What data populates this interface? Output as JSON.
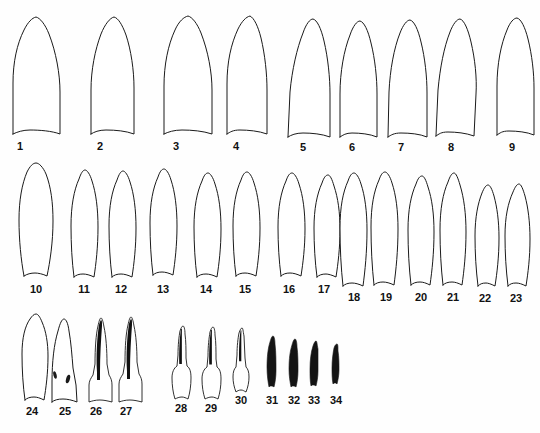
{
  "figure": {
    "kind": "scientific-plate",
    "background_color": "#fefefe",
    "outline_color": "#1a1a1a",
    "fill_color": "#ffffff",
    "solid_color": "#141414",
    "label_color": "#111111",
    "item_count": 34,
    "rows": [
      {
        "name": "row-1",
        "labels_from": 1,
        "labels_to": 9
      },
      {
        "name": "row-2",
        "labels_from": 10,
        "labels_to": 23
      },
      {
        "name": "row-3",
        "labels_from": 24,
        "labels_to": 34
      }
    ]
  },
  "specimens": [
    {
      "label": "1",
      "row": 1,
      "style": "outline",
      "label_x": 20,
      "label_y": 150,
      "path": "M 13 134 L 13 83 C 13 62 17 44 24 30 C 28 22 32 18 36 17 C 40 18 45 24 49 34 C 56 52 60 74 60 92 L 60 134 C 52 131 40 130 30 130 C 23 130 17 132 13 134 Z"
    },
    {
      "label": "2",
      "row": 1,
      "style": "outline",
      "label_x": 100,
      "label_y": 150,
      "path": "M 91 134 L 91 90 C 91 70 95 50 101 34 C 105 24 110 18 114 17 C 118 18 122 24 126 35 C 131 50 134 70 134 88 L 134 134 C 126 131 116 130 106 130 C 99 130 94 132 91 134 Z"
    },
    {
      "label": "3",
      "row": 1,
      "style": "outline",
      "label_x": 176,
      "label_y": 150,
      "path": "M 164 134 L 164 86 C 164 65 168 45 175 30 C 179 21 184 17 188 16 C 192 17 197 23 201 33 C 208 51 212 72 212 90 L 212 134 C 203 131 192 130 182 130 C 174 130 168 132 164 134 Z"
    },
    {
      "label": "4",
      "row": 1,
      "style": "outline",
      "label_x": 236,
      "label_y": 150,
      "path": "M 227 134 L 227 84 C 227 62 231 44 238 29 C 242 21 246 17 250 16 C 254 18 258 26 261 38 C 265 55 267 74 267 90 L 267 134 C 259 131 248 130 240 130 C 233 130 230 132 227 134 Z"
    },
    {
      "label": "5",
      "row": 1,
      "style": "outline",
      "label_x": 303,
      "label_y": 151,
      "path": "M 288 137 L 290 92 C 292 70 297 48 303 33 C 306 24 310 19 313 19 C 317 20 321 28 324 41 C 328 58 330 78 330 94 L 330 137 C 322 134 312 133 303 133 C 296 133 291 135 288 137 Z"
    },
    {
      "label": "6",
      "row": 1,
      "style": "outline",
      "label_x": 352,
      "label_y": 151,
      "path": "M 340 137 L 340 94 C 340 72 344 50 350 35 C 353 26 357 21 360 21 C 364 22 368 30 371 43 C 375 59 377 78 377 94 L 377 137 C 370 134 360 133 352 133 C 346 133 343 135 340 137 Z"
    },
    {
      "label": "7",
      "row": 1,
      "style": "outline",
      "label_x": 401,
      "label_y": 151,
      "path": "M 388 137 L 389 92 C 390 70 394 48 400 33 C 403 25 407 20 410 20 C 414 21 418 29 421 42 C 425 58 427 77 427 93 L 427 137 C 420 134 410 133 401 133 C 394 133 391 135 388 137 Z"
    },
    {
      "label": "8",
      "row": 1,
      "style": "outline",
      "label_x": 451,
      "label_y": 151,
      "path": "M 436 136 L 438 90 C 440 68 444 47 450 32 C 453 24 457 19 460 19 C 464 20 468 29 471 42 C 475 59 477 78 476 94 L 474 136 C 466 133 456 132 448 132 C 441 132 439 134 436 136 Z"
    },
    {
      "label": "9",
      "row": 1,
      "style": "outline",
      "label_x": 512,
      "label_y": 151,
      "path": "M 497 135 L 497 86 C 497 64 501 44 507 30 C 510 22 514 18 517 18 C 521 19 525 27 528 39 C 532 55 534 73 534 88 L 534 135 C 527 132 517 131 509 131 C 502 131 500 133 497 135 Z"
    },
    {
      "label": "10",
      "row": 2,
      "style": "outline",
      "label_x": 36,
      "label_y": 293,
      "path": "M 24 276 C 21 260 19 240 19 220 C 19 200 22 184 27 172 C 30 166 33 163 36 163 C 39 163 43 167 46 174 C 51 187 53 203 53 221 C 53 242 50 262 47 276 C 43 274 38 273 35 273 C 31 273 27 274 24 276 Z"
    },
    {
      "label": "11",
      "row": 2,
      "style": "outline",
      "label_x": 84,
      "label_y": 293,
      "path": "M 74 277 C 72 262 71 244 71 226 C 71 206 74 190 79 179 C 81 173 83 170 85 170 C 87 170 90 174 92 181 C 96 193 98 209 98 227 C 98 247 96 264 94 277 C 90 275 86 274 83 274 C 79 274 76 275 74 277 Z"
    },
    {
      "label": "12",
      "row": 2,
      "style": "outline",
      "label_x": 121,
      "label_y": 293,
      "path": "M 112 277 C 110 261 109 243 109 226 C 109 206 112 191 117 180 C 119 174 121 171 123 171 C 125 171 128 175 130 182 C 134 194 136 210 136 228 C 136 247 134 264 132 277 C 128 275 124 274 121 274 C 117 274 114 275 112 277 Z"
    },
    {
      "label": "13",
      "row": 2,
      "style": "outline",
      "label_x": 163,
      "label_y": 293,
      "path": "M 153 275 C 151 259 150 241 150 223 C 150 203 153 188 158 177 C 160 171 162 169 164 169 C 166 169 169 173 171 180 C 175 192 177 208 177 226 C 177 245 175 262 173 275 C 169 273 165 272 162 272 C 158 272 155 273 153 275 Z"
    },
    {
      "label": "14",
      "row": 2,
      "style": "outline",
      "label_x": 206,
      "label_y": 293,
      "path": "M 197 277 C 195 262 194 244 194 227 C 194 207 197 192 202 181 C 204 175 206 173 208 173 C 210 173 213 177 215 184 C 219 196 221 211 221 229 C 221 248 219 264 217 277 C 213 275 209 274 206 274 C 202 274 199 275 197 277 Z"
    },
    {
      "label": "15",
      "row": 2,
      "style": "outline",
      "label_x": 245,
      "label_y": 293,
      "path": "M 236 276 C 234 261 233 243 233 226 C 233 206 236 191 241 180 C 243 174 245 172 247 172 C 249 172 252 176 254 183 C 258 195 260 210 260 228 C 260 247 258 263 256 276 C 252 274 248 273 245 273 C 241 273 238 274 236 276 Z"
    },
    {
      "label": "16",
      "row": 2,
      "style": "outline",
      "label_x": 289,
      "label_y": 293,
      "path": "M 281 276 C 279 261 278 244 278 227 C 278 207 281 192 286 181 C 288 175 290 173 292 173 C 294 173 297 177 299 184 C 303 196 305 211 305 229 C 305 247 303 263 301 276 C 297 274 293 273 290 273 C 286 273 283 274 281 276 Z"
    },
    {
      "label": "17",
      "row": 2,
      "style": "outline",
      "label_x": 324,
      "label_y": 293,
      "path": "M 317 277 C 315 262 314 245 314 228 C 314 209 317 194 322 183 C 324 177 326 175 328 175 C 330 175 332 179 334 186 C 338 198 340 212 340 230 C 340 248 338 264 336 277 C 332 275 328 274 326 274 C 322 274 319 275 317 277 Z"
    },
    {
      "label": "18",
      "row": 2,
      "style": "outline",
      "label_x": 354,
      "label_y": 301,
      "path": "M 343 286 C 341 268 340 248 340 228 C 340 207 343 192 348 181 C 350 175 352 173 354 173 C 356 173 359 177 361 184 C 365 196 367 212 367 230 C 367 252 365 271 363 286 C 359 284 355 283 352 283 C 348 283 345 284 343 286 Z"
    },
    {
      "label": "19",
      "row": 2,
      "style": "outline",
      "label_x": 386,
      "label_y": 301,
      "path": "M 374 285 C 372 267 371 247 371 227 C 371 206 374 191 379 180 C 381 174 383 172 385 172 C 387 172 390 176 392 183 C 396 195 398 211 398 229 C 398 251 396 270 394 285 C 390 283 386 282 383 282 C 379 282 376 283 374 285 Z"
    },
    {
      "label": "20",
      "row": 2,
      "style": "outline",
      "label_x": 421,
      "label_y": 301,
      "path": "M 411 285 C 409 268 408 249 408 230 C 408 210 411 195 416 184 C 418 178 420 176 422 176 C 424 176 426 180 428 187 C 432 199 434 214 434 232 C 434 253 432 271 430 285 C 426 283 423 282 420 282 C 416 282 413 283 411 285 Z"
    },
    {
      "label": "21",
      "row": 2,
      "style": "outline",
      "label_x": 453,
      "label_y": 301,
      "path": "M 443 285 C 441 268 440 249 440 230 C 440 209 443 193 448 182 C 450 176 452 173 454 173 C 456 173 458 178 460 185 C 464 198 466 214 466 232 C 466 253 464 271 462 285 C 458 283 455 282 452 282 C 448 282 445 283 443 285 Z"
    },
    {
      "label": "22",
      "row": 2,
      "style": "outline",
      "label_x": 485,
      "label_y": 302,
      "path": "M 478 286 C 476 270 475 253 475 236 C 475 217 478 203 482 193 C 484 188 486 185 488 185 C 490 185 492 189 494 196 C 497 207 499 221 499 238 C 499 257 497 273 495 286 C 491 284 488 283 486 283 C 482 283 480 284 478 286 Z"
    },
    {
      "label": "23",
      "row": 2,
      "style": "outline",
      "label_x": 516,
      "label_y": 302,
      "path": "M 508 286 C 506 270 505 253 505 236 C 505 217 508 203 513 192 C 515 187 517 184 519 184 C 521 184 523 189 525 196 C 528 207 530 222 530 239 C 530 258 528 273 526 286 C 522 284 519 283 516 283 C 512 283 510 284 508 286 Z"
    },
    {
      "label": "24",
      "row": 3,
      "style": "outline",
      "label_x": 32,
      "label_y": 415,
      "path": "M 25 400 C 23 386 22 370 22 354 C 22 338 25 326 30 319 C 32 316 34 314 36 314 C 38 314 40 317 42 322 C 46 331 48 343 48 356 C 48 373 46 388 44 400 C 40 398 37 397 34 397 C 30 397 27 398 25 400 Z"
    },
    {
      "label": "25",
      "row": 3,
      "style": "outline",
      "label_x": 65,
      "label_y": 415,
      "speckles": [
        {
          "cx": 55,
          "cy": 375,
          "rx": 1.6,
          "ry": 3.8,
          "rot": -14
        },
        {
          "cx": 68,
          "cy": 379,
          "rx": 1.9,
          "ry": 4.4,
          "rot": 16
        }
      ],
      "path": "M 52 402 L 52 382 C 52 362 54 344 58 331 C 60 323 62 319 64 319 C 66 319 68 323 69 331 C 71 342 72 356 73 368 L 76 385 L 77 402 C 72 400 67 399 63 399 C 58 399 54 400 52 402 Z"
    },
    {
      "label": "26",
      "row": 3,
      "style": "outline-ridge",
      "label_x": 96,
      "label_y": 415,
      "path": "M 89 402 L 89 385 C 89 381 91 378 93 375 L 95 364 C 95 348 96 334 98 326 C 99 321 100 318 101 318 C 102 318 103 321 104 327 C 106 336 107 350 107 364 L 109 375 C 111 378 112 381 112 385 L 112 402 C 108 401 104 400 100 400 C 95 400 92 401 89 402 Z",
      "ridge_path": "M 97 372 C 96 356 97 338 99 325 C 100 321 101 320 101 320 C 102 320 102 322 102 326 C 101 340 100 356 100 372 L 100 380 L 97 380 Z"
    },
    {
      "label": "27",
      "row": 3,
      "style": "outline-ridge",
      "label_x": 126,
      "label_y": 415,
      "path": "M 119 402 L 119 384 C 119 380 121 377 123 374 L 125 362 C 125 346 126 333 128 325 C 129 320 130 317 131 317 C 132 317 133 320 134 326 C 136 335 137 348 137 362 L 139 374 C 141 377 142 380 142 384 L 142 402 C 138 401 134 400 130 400 C 125 400 122 401 119 402 Z",
      "ridge_path": "M 127 371 C 126 355 127 337 129 324 C 130 320 131 319 131 319 C 132 319 132 321 132 325 C 131 339 130 355 130 371 L 130 379 L 127 379 Z"
    },
    {
      "label": "28",
      "row": 3,
      "style": "outline-ridge",
      "label_x": 181,
      "label_y": 412,
      "path": "M 175 399 C 173 393 172 385 172 378 C 172 372 174 368 177 366 L 178 355 C 178 345 179 336 180 331 C 181 328 182 326 183 326 C 184 326 185 329 185 334 C 186 341 186 350 186 358 L 187 366 C 190 368 191 372 191 378 C 191 385 190 393 188 399 C 186 398 184 397 182 397 C 179 397 177 398 175 399 Z"
    },
    {
      "label": "29",
      "row": 3,
      "style": "outline-ridge",
      "label_x": 211,
      "label_y": 412,
      "path": "M 205 399 C 203 393 202 386 202 379 C 202 373 204 369 207 367 L 208 356 C 208 346 209 338 210 332 C 211 329 212 327 213 327 C 214 327 215 330 215 335 C 216 342 216 351 216 359 L 217 367 C 220 369 221 373 221 379 C 221 386 220 393 218 399 C 216 398 214 397 212 397 C 209 397 207 398 205 399 Z"
    },
    {
      "label": "30",
      "row": 3,
      "style": "outline-ridge",
      "label_x": 241,
      "label_y": 404,
      "path": "M 236 392 C 234 387 233 382 233 377 C 233 372 234 369 236 367 L 237 355 C 237 346 238 338 239 333 C 240 330 241 328 242 328 C 243 328 243 331 244 336 C 244 343 245 351 245 358 L 246 367 C 248 369 249 372 249 377 C 249 382 248 387 246 392 C 244 391 243 390 241 390 C 239 390 237 391 236 392 Z"
    },
    {
      "label": "31",
      "row": 3,
      "style": "solid",
      "label_x": 272,
      "label_y": 404,
      "path": "M 269 387 C 268 382 267 375 267 367 C 267 357 268 348 270 342 C 271 338 272 336 273 336 C 274 336 275 339 275 344 C 276 352 276 362 276 371 C 276 377 275 383 274 387 C 273 386 272 386 271 386 C 270 386 270 386 269 387 Z"
    },
    {
      "label": "32",
      "row": 3,
      "style": "solid",
      "label_x": 294,
      "label_y": 404,
      "path": "M 291 387 C 290 382 289 376 289 369 C 289 359 290 351 292 345 C 293 341 294 339 295 339 C 296 339 297 342 297 347 C 298 354 298 363 298 371 C 298 377 297 383 296 387 C 295 386 294 386 293 386 C 292 386 292 386 291 387 Z"
    },
    {
      "label": "33",
      "row": 3,
      "style": "solid",
      "label_x": 314,
      "label_y": 404,
      "path": "M 311 386 C 310 381 310 375 310 369 C 310 360 311 352 313 346 C 314 343 315 341 316 341 C 317 341 317 344 318 349 C 318 356 318 364 318 371 C 318 377 317 382 316 386 C 315 385 314 385 313 385 C 312 385 312 385 311 386 Z"
    },
    {
      "label": "34",
      "row": 3,
      "style": "solid",
      "label_x": 336,
      "label_y": 404,
      "path": "M 333 384 C 332 379 332 373 332 368 C 332 360 333 353 334 348 C 335 345 336 344 337 344 C 338 344 338 347 338 351 C 339 357 339 364 339 370 C 339 375 338 380 337 384 C 336 383 336 383 335 383 C 334 383 334 383 333 384 Z"
    }
  ]
}
